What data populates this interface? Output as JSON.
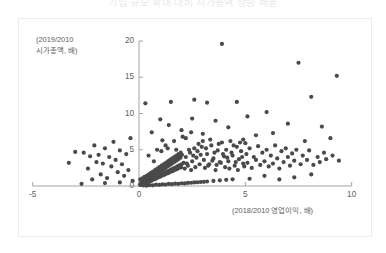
{
  "title": "기업 규모 확대 대비 시가총액 상승 배율",
  "axis": {
    "ylabel_line1": "(2019/2010",
    "ylabel_line2": "시가총액, 배)",
    "xlabel": "(2018/2010 영업이익, 배)"
  },
  "colors": {
    "marker": "#4a4a4a",
    "axis": "#9a9a9e",
    "text": "#5e5e62",
    "frame": "#ececee",
    "background": "#ffffff"
  },
  "chart_data": {
    "type": "scatter",
    "title": "기업 규모 확대 대비 시가총액 상승 배율",
    "xlabel": "(2018/2010 영업이익, 배)",
    "ylabel": "(2019/2010 시가총액, 배)",
    "xlim": [
      -5,
      10
    ],
    "ylim": [
      0,
      20
    ],
    "xticks": [
      -5,
      0,
      5,
      10
    ],
    "yticks": [
      0,
      5,
      10,
      15,
      20
    ],
    "xtick_labels": [
      "-5",
      "0",
      "5",
      "10"
    ],
    "ytick_labels": [
      "0",
      "5",
      "10",
      "15",
      "20"
    ],
    "grid": false,
    "legend": null,
    "marker_color": "#4a4a4a",
    "marker_size": 4.2,
    "n_points": 281,
    "points": [
      [
        3.9,
        19.6
      ],
      [
        7.5,
        17.0
      ],
      [
        9.3,
        15.2
      ],
      [
        8.1,
        12.3
      ],
      [
        2.6,
        11.9
      ],
      [
        1.5,
        11.6
      ],
      [
        3.2,
        11.5
      ],
      [
        4.6,
        11.6
      ],
      [
        0.3,
        11.4
      ],
      [
        6.0,
        10.2
      ],
      [
        5.1,
        9.6
      ],
      [
        2.5,
        9.3
      ],
      [
        3.6,
        9.0
      ],
      [
        1.0,
        9.2
      ],
      [
        7.0,
        8.6
      ],
      [
        8.6,
        8.2
      ],
      [
        4.2,
        8.1
      ],
      [
        1.4,
        8.4
      ],
      [
        2.0,
        7.7
      ],
      [
        6.3,
        7.3
      ],
      [
        5.5,
        7.0
      ],
      [
        3.0,
        7.2
      ],
      [
        0.6,
        7.4
      ],
      [
        9.0,
        6.6
      ],
      [
        7.8,
        6.2
      ],
      [
        4.9,
        6.4
      ],
      [
        2.2,
        6.6
      ],
      [
        1.1,
        6.3
      ],
      [
        -0.4,
        6.6
      ],
      [
        -1.2,
        6.1
      ],
      [
        -2.1,
        5.6
      ],
      [
        -1.6,
        5.2
      ],
      [
        -2.6,
        4.6
      ],
      [
        -0.9,
        4.9
      ],
      [
        -1.9,
        4.3
      ],
      [
        -2.3,
        4.1
      ],
      [
        -1.4,
        4.0
      ],
      [
        -0.6,
        4.4
      ],
      [
        -1.1,
        3.6
      ],
      [
        -2.0,
        3.3
      ],
      [
        -1.7,
        3.1
      ],
      [
        -0.8,
        3.0
      ],
      [
        -1.3,
        2.7
      ],
      [
        -2.4,
        2.4
      ],
      [
        -0.5,
        2.2
      ],
      [
        -1.0,
        1.9
      ],
      [
        -1.8,
        1.6
      ],
      [
        -0.7,
        1.4
      ],
      [
        -1.5,
        1.1
      ],
      [
        -2.2,
        0.9
      ],
      [
        -0.3,
        0.7
      ],
      [
        -0.9,
        0.5
      ],
      [
        -1.6,
        0.4
      ],
      [
        -2.7,
        0.3
      ],
      [
        -3.0,
        4.7
      ],
      [
        -3.3,
        3.2
      ],
      [
        0.05,
        0.2
      ],
      [
        0.1,
        0.35
      ],
      [
        0.15,
        0.5
      ],
      [
        0.2,
        0.3
      ],
      [
        0.25,
        0.6
      ],
      [
        0.3,
        0.45
      ],
      [
        0.35,
        0.8
      ],
      [
        0.4,
        0.55
      ],
      [
        0.45,
        0.9
      ],
      [
        0.5,
        0.7
      ],
      [
        0.55,
        1.1
      ],
      [
        0.6,
        0.85
      ],
      [
        0.65,
        1.3
      ],
      [
        0.7,
        1.0
      ],
      [
        0.75,
        1.5
      ],
      [
        0.8,
        1.2
      ],
      [
        0.85,
        1.7
      ],
      [
        0.9,
        1.35
      ],
      [
        0.95,
        1.9
      ],
      [
        1.0,
        1.5
      ],
      [
        1.05,
        2.1
      ],
      [
        1.1,
        1.65
      ],
      [
        1.15,
        2.3
      ],
      [
        1.2,
        1.8
      ],
      [
        1.25,
        2.5
      ],
      [
        1.3,
        1.95
      ],
      [
        1.35,
        2.7
      ],
      [
        1.4,
        2.1
      ],
      [
        1.45,
        2.9
      ],
      [
        1.5,
        2.25
      ],
      [
        1.55,
        3.1
      ],
      [
        1.6,
        2.4
      ],
      [
        1.65,
        3.3
      ],
      [
        1.7,
        2.55
      ],
      [
        1.75,
        3.5
      ],
      [
        1.8,
        2.7
      ],
      [
        1.85,
        3.7
      ],
      [
        1.9,
        2.85
      ],
      [
        1.95,
        3.9
      ],
      [
        2.0,
        3.0
      ],
      [
        0.08,
        0.15
      ],
      [
        0.18,
        0.25
      ],
      [
        0.28,
        0.38
      ],
      [
        0.38,
        0.48
      ],
      [
        0.48,
        0.62
      ],
      [
        0.58,
        0.72
      ],
      [
        0.68,
        0.88
      ],
      [
        0.78,
        0.98
      ],
      [
        0.88,
        1.15
      ],
      [
        0.98,
        1.25
      ],
      [
        1.08,
        1.42
      ],
      [
        1.18,
        1.52
      ],
      [
        1.28,
        1.68
      ],
      [
        1.38,
        1.78
      ],
      [
        1.48,
        1.95
      ],
      [
        1.58,
        2.05
      ],
      [
        1.68,
        2.22
      ],
      [
        1.78,
        2.32
      ],
      [
        1.88,
        2.48
      ],
      [
        1.98,
        2.58
      ],
      [
        0.12,
        0.55
      ],
      [
        0.22,
        0.7
      ],
      [
        0.32,
        0.95
      ],
      [
        0.42,
        1.1
      ],
      [
        0.52,
        1.35
      ],
      [
        0.62,
        1.5
      ],
      [
        0.72,
        1.75
      ],
      [
        0.82,
        1.9
      ],
      [
        0.92,
        2.15
      ],
      [
        1.02,
        2.3
      ],
      [
        1.12,
        2.55
      ],
      [
        1.22,
        2.7
      ],
      [
        1.32,
        2.95
      ],
      [
        1.42,
        3.1
      ],
      [
        1.52,
        3.35
      ],
      [
        1.62,
        3.5
      ],
      [
        1.72,
        3.75
      ],
      [
        1.82,
        3.9
      ],
      [
        1.92,
        4.15
      ],
      [
        2.02,
        4.3
      ],
      [
        0.06,
        0.9
      ],
      [
        0.16,
        1.05
      ],
      [
        0.26,
        1.25
      ],
      [
        0.36,
        1.4
      ],
      [
        0.46,
        1.6
      ],
      [
        0.56,
        1.8
      ],
      [
        0.66,
        2.0
      ],
      [
        0.76,
        2.2
      ],
      [
        0.86,
        2.4
      ],
      [
        0.96,
        2.6
      ],
      [
        1.06,
        2.8
      ],
      [
        1.16,
        3.0
      ],
      [
        1.26,
        3.2
      ],
      [
        1.36,
        3.4
      ],
      [
        1.46,
        3.6
      ],
      [
        1.56,
        3.8
      ],
      [
        1.66,
        4.0
      ],
      [
        1.76,
        4.2
      ],
      [
        1.86,
        4.4
      ],
      [
        1.96,
        4.6
      ],
      [
        2.1,
        3.2
      ],
      [
        2.2,
        4.0
      ],
      [
        2.3,
        2.8
      ],
      [
        2.4,
        4.6
      ],
      [
        2.5,
        3.4
      ],
      [
        2.6,
        5.2
      ],
      [
        2.7,
        3.9
      ],
      [
        2.8,
        5.8
      ],
      [
        2.9,
        4.3
      ],
      [
        3.0,
        6.2
      ],
      [
        2.15,
        2.4
      ],
      [
        2.25,
        3.1
      ],
      [
        2.35,
        5.0
      ],
      [
        2.45,
        2.2
      ],
      [
        2.55,
        4.2
      ],
      [
        2.65,
        2.6
      ],
      [
        2.75,
        4.8
      ],
      [
        2.85,
        3.0
      ],
      [
        2.95,
        5.4
      ],
      [
        3.05,
        3.6
      ],
      [
        3.1,
        2.5
      ],
      [
        3.2,
        4.4
      ],
      [
        3.3,
        3.0
      ],
      [
        3.4,
        5.6
      ],
      [
        3.5,
        3.8
      ],
      [
        3.6,
        2.2
      ],
      [
        3.7,
        4.9
      ],
      [
        3.8,
        3.3
      ],
      [
        3.9,
        6.0
      ],
      [
        4.0,
        4.1
      ],
      [
        3.15,
        5.2
      ],
      [
        3.25,
        2.8
      ],
      [
        3.35,
        6.4
      ],
      [
        3.45,
        3.5
      ],
      [
        3.55,
        4.6
      ],
      [
        3.65,
        2.9
      ],
      [
        3.75,
        5.8
      ],
      [
        3.85,
        3.2
      ],
      [
        3.95,
        4.4
      ],
      [
        4.05,
        2.6
      ],
      [
        4.1,
        5.0
      ],
      [
        4.2,
        3.4
      ],
      [
        4.3,
        6.2
      ],
      [
        4.4,
        4.2
      ],
      [
        4.5,
        2.8
      ],
      [
        4.6,
        5.4
      ],
      [
        4.7,
        3.7
      ],
      [
        4.8,
        4.8
      ],
      [
        4.9,
        3.1
      ],
      [
        5.0,
        5.9
      ],
      [
        4.15,
        3.9
      ],
      [
        4.25,
        2.4
      ],
      [
        4.35,
        4.6
      ],
      [
        4.45,
        5.6
      ],
      [
        4.55,
        3.3
      ],
      [
        4.65,
        2.2
      ],
      [
        4.75,
        6.0
      ],
      [
        4.85,
        4.0
      ],
      [
        4.95,
        2.7
      ],
      [
        5.05,
        4.4
      ],
      [
        5.1,
        3.2
      ],
      [
        5.2,
        5.2
      ],
      [
        5.3,
        2.5
      ],
      [
        5.4,
        4.0
      ],
      [
        5.5,
        3.6
      ],
      [
        5.6,
        5.5
      ],
      [
        5.7,
        2.9
      ],
      [
        5.8,
        4.6
      ],
      [
        5.9,
        3.4
      ],
      [
        6.0,
        5.0
      ],
      [
        6.1,
        2.7
      ],
      [
        6.2,
        4.2
      ],
      [
        6.3,
        3.1
      ],
      [
        6.4,
        5.6
      ],
      [
        6.5,
        3.8
      ],
      [
        6.6,
        2.4
      ],
      [
        6.7,
        4.8
      ],
      [
        6.8,
        3.3
      ],
      [
        6.9,
        5.2
      ],
      [
        7.0,
        4.0
      ],
      [
        7.1,
        2.8
      ],
      [
        7.2,
        4.5
      ],
      [
        7.3,
        3.5
      ],
      [
        7.4,
        5.0
      ],
      [
        7.6,
        3.0
      ],
      [
        7.7,
        4.2
      ],
      [
        7.9,
        3.6
      ],
      [
        8.0,
        4.9
      ],
      [
        8.2,
        2.9
      ],
      [
        8.4,
        4.0
      ],
      [
        8.5,
        3.3
      ],
      [
        8.7,
        4.6
      ],
      [
        8.8,
        3.7
      ],
      [
        9.1,
        4.2
      ],
      [
        9.4,
        3.5
      ],
      [
        0.2,
        0.08
      ],
      [
        0.5,
        0.12
      ],
      [
        0.8,
        0.18
      ],
      [
        1.1,
        0.22
      ],
      [
        1.4,
        0.28
      ],
      [
        1.7,
        0.32
      ],
      [
        2.0,
        0.38
      ],
      [
        2.3,
        0.42
      ],
      [
        2.6,
        0.5
      ],
      [
        2.9,
        0.55
      ],
      [
        3.2,
        0.62
      ],
      [
        3.5,
        0.7
      ],
      [
        3.8,
        0.78
      ],
      [
        4.1,
        0.85
      ],
      [
        4.4,
        0.92
      ],
      [
        0.35,
        0.05
      ],
      [
        0.65,
        0.1
      ],
      [
        0.95,
        0.15
      ],
      [
        1.25,
        0.2
      ],
      [
        1.55,
        0.25
      ],
      [
        1.85,
        0.3
      ],
      [
        2.15,
        0.35
      ],
      [
        2.45,
        0.45
      ],
      [
        2.75,
        0.52
      ],
      [
        3.05,
        0.58
      ],
      [
        5.2,
        1.0
      ],
      [
        5.9,
        1.4
      ],
      [
        6.6,
        0.9
      ],
      [
        7.3,
        1.2
      ],
      [
        8.1,
        1.6
      ],
      [
        2.05,
        6.8
      ],
      [
        2.45,
        7.4
      ],
      [
        1.25,
        5.6
      ],
      [
        0.85,
        5.0
      ],
      [
        1.65,
        6.2
      ],
      [
        0.45,
        4.2
      ],
      [
        0.7,
        3.4
      ],
      [
        1.05,
        4.8
      ],
      [
        1.35,
        5.2
      ],
      [
        1.75,
        5.0
      ]
    ]
  }
}
